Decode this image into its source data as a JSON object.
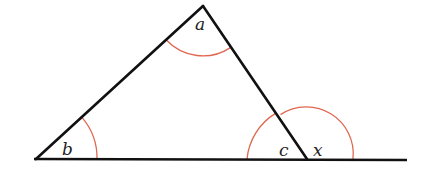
{
  "diagram": {
    "type": "triangle-exterior-angle",
    "labels": {
      "a": "a",
      "b": "b",
      "c": "c",
      "x": "x"
    },
    "colors": {
      "lines": "#111111",
      "arcs": "#e0674f",
      "background": "#ffffff"
    },
    "vertices": {
      "A": [
        203,
        6
      ],
      "B": [
        36,
        159
      ],
      "C": [
        307,
        159
      ]
    },
    "baseline_end": [
      407,
      159
    ]
  }
}
